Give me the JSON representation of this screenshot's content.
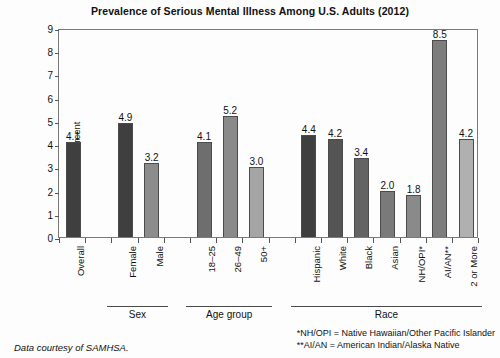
{
  "chart_data": {
    "type": "bar",
    "title": "Prevalence of Serious Mental Illness Among U.S. Adults (2012)",
    "xlabel": "",
    "ylabel": "Percent",
    "ylim": [
      0,
      9
    ],
    "yticks": [
      "0",
      "1",
      "2",
      "3",
      "4",
      "5",
      "6",
      "7",
      "8",
      "9"
    ],
    "grid": false,
    "legend": "none",
    "categories": [
      "Overall",
      "Female",
      "Male",
      "18–25",
      "26–49",
      "50+",
      "Hispanic",
      "White",
      "Black",
      "Asian",
      "NH/OPI*",
      "AI/AN**",
      "2 or More"
    ],
    "values": [
      4.1,
      4.9,
      3.2,
      4.1,
      5.2,
      3.0,
      4.4,
      4.2,
      3.4,
      2.0,
      1.8,
      8.5,
      4.2
    ],
    "value_labels": [
      "4.1",
      "4.9",
      "3.2",
      "4.1",
      "5.2",
      "3.0",
      "4.4",
      "4.2",
      "3.4",
      "2.0",
      "1.8",
      "8.5",
      "4.2"
    ],
    "bar_colors": [
      "#3f3f3f",
      "#3f3f3f",
      "#8c8c8c",
      "#6e6e6e",
      "#8a8a8a",
      "#a5a5a5",
      "#3f3f3f",
      "#545454",
      "#636363",
      "#7a7a7a",
      "#8a8a8a",
      "#7d7d7d",
      "#b0b0b0"
    ],
    "groups": [
      {
        "label": "Sex",
        "start_index": 1,
        "end_index": 2
      },
      {
        "label": "Age group",
        "start_index": 3,
        "end_index": 5
      },
      {
        "label": "Race",
        "start_index": 6,
        "end_index": 12
      }
    ]
  },
  "notes": {
    "source": "Data courtesy of SAMHSA.",
    "footnote_1": "*NH/OPI = Native Hawaiian/Other Pacific Islander",
    "footnote_2": "**AI/AN = American Indian/Alaska Native"
  }
}
